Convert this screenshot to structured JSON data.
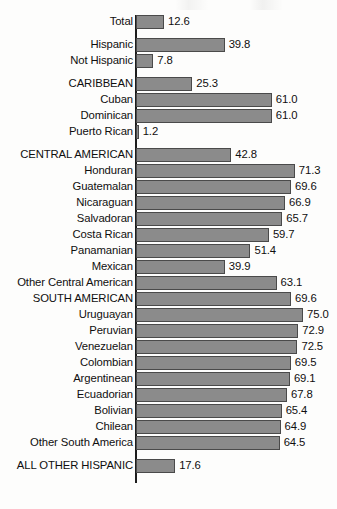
{
  "chart_data": {
    "type": "bar",
    "title": "",
    "subtitle": "",
    "xlabel": "",
    "ylabel": "",
    "orientation": "horizontal",
    "grid": false,
    "legend": null,
    "axis_baseline": 0,
    "xlim": [
      0,
      75
    ],
    "value_format": "one-decimal",
    "categories": [
      "Total",
      "Hispanic",
      "Not Hispanic",
      "CARIBBEAN",
      "Cuban",
      "Dominican",
      "Puerto Rican",
      "CENTRAL AMERICAN",
      "Honduran",
      "Guatemalan",
      "Nicaraguan",
      "Salvadoran",
      "Costa Rican",
      "Panamanian",
      "Mexican",
      "Other Central American",
      "SOUTH AMERICAN",
      "Uruguayan",
      "Peruvian",
      "Venezuelan",
      "Colombian",
      "Argentinean",
      "Ecuadorian",
      "Bolivian",
      "Chilean",
      "Other South America",
      "ALL OTHER HISPANIC"
    ],
    "values": [
      12.6,
      39.8,
      7.8,
      25.3,
      61.0,
      61.0,
      1.2,
      42.8,
      71.3,
      69.6,
      66.9,
      65.7,
      59.7,
      51.4,
      39.9,
      63.1,
      69.6,
      75.0,
      72.9,
      72.5,
      69.5,
      69.1,
      67.8,
      65.4,
      64.9,
      64.5,
      17.6
    ],
    "rows": [
      {
        "label": "Total",
        "value": 12.6,
        "display": "12.6",
        "group_break": false
      },
      {
        "label": "Hispanic",
        "value": 39.8,
        "display": "39.8",
        "group_break": true
      },
      {
        "label": "Not Hispanic",
        "value": 7.8,
        "display": "7.8",
        "group_break": false
      },
      {
        "label": "CARIBBEAN",
        "value": 25.3,
        "display": "25.3",
        "group_break": true
      },
      {
        "label": "Cuban",
        "value": 61.0,
        "display": "61.0",
        "group_break": false
      },
      {
        "label": "Dominican",
        "value": 61.0,
        "display": "61.0",
        "group_break": false
      },
      {
        "label": "Puerto Rican",
        "value": 1.2,
        "display": "1.2",
        "group_break": false
      },
      {
        "label": "CENTRAL AMERICAN",
        "value": 42.8,
        "display": "42.8",
        "group_break": true
      },
      {
        "label": "Honduran",
        "value": 71.3,
        "display": "71.3",
        "group_break": false
      },
      {
        "label": "Guatemalan",
        "value": 69.6,
        "display": "69.6",
        "group_break": false
      },
      {
        "label": "Nicaraguan",
        "value": 66.9,
        "display": "66.9",
        "group_break": false
      },
      {
        "label": "Salvadoran",
        "value": 65.7,
        "display": "65.7",
        "group_break": false
      },
      {
        "label": "Costa Rican",
        "value": 59.7,
        "display": "59.7",
        "group_break": false
      },
      {
        "label": "Panamanian",
        "value": 51.4,
        "display": "51.4",
        "group_break": false
      },
      {
        "label": "Mexican",
        "value": 39.9,
        "display": "39.9",
        "group_break": false
      },
      {
        "label": "Other Central American",
        "value": 63.1,
        "display": "63.1",
        "group_break": false
      },
      {
        "label": "SOUTH AMERICAN",
        "value": 69.6,
        "display": "69.6",
        "group_break": false
      },
      {
        "label": "Uruguayan",
        "value": 75.0,
        "display": "75.0",
        "group_break": false
      },
      {
        "label": "Peruvian",
        "value": 72.9,
        "display": "72.9",
        "group_break": false
      },
      {
        "label": "Venezuelan",
        "value": 72.5,
        "display": "72.5",
        "group_break": false
      },
      {
        "label": "Colombian",
        "value": 69.5,
        "display": "69.5",
        "group_break": false
      },
      {
        "label": "Argentinean",
        "value": 69.1,
        "display": "69.1",
        "group_break": false
      },
      {
        "label": "Ecuadorian",
        "value": 67.8,
        "display": "67.8",
        "group_break": false
      },
      {
        "label": "Bolivian",
        "value": 65.4,
        "display": "65.4",
        "group_break": false
      },
      {
        "label": "Chilean",
        "value": 64.9,
        "display": "64.9",
        "group_break": false
      },
      {
        "label": "Other South America",
        "value": 64.5,
        "display": "64.5",
        "group_break": false
      },
      {
        "label": "ALL OTHER HISPANIC",
        "value": 17.6,
        "display": "17.6",
        "group_break": true
      }
    ]
  },
  "style": {
    "bar_fill": "#8b8b8b",
    "bar_stroke": "#4a4a4a",
    "text_color": "#100f0f",
    "background": "#fdfdfc",
    "axis_color": "#1d1d1d"
  },
  "geometry": {
    "baseline_x_px": 135,
    "px_per_unit": 2.227,
    "bar_height_px": 14,
    "row_gap_px": 2,
    "group_gap_px": 9
  }
}
